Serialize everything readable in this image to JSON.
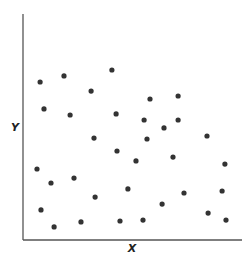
{
  "chart_data": {
    "type": "scatter",
    "title": "",
    "xlabel": "X",
    "ylabel": "Y",
    "xlim": [
      0,
      100
    ],
    "ylim": [
      0,
      100
    ],
    "grid": false,
    "legend": null,
    "ticks": "none",
    "point_color": "#333333",
    "axis_color": "#555555",
    "points": [
      {
        "x": 7.8,
        "y": 69.9
      },
      {
        "x": 18.7,
        "y": 72.6
      },
      {
        "x": 31.1,
        "y": 65.9
      },
      {
        "x": 40.6,
        "y": 75.2
      },
      {
        "x": 9.6,
        "y": 58.0
      },
      {
        "x": 21.5,
        "y": 55.3
      },
      {
        "x": 42.5,
        "y": 55.8
      },
      {
        "x": 58.0,
        "y": 62.4
      },
      {
        "x": 70.8,
        "y": 63.7
      },
      {
        "x": 55.3,
        "y": 53.1
      },
      {
        "x": 64.4,
        "y": 49.6
      },
      {
        "x": 70.8,
        "y": 53.1
      },
      {
        "x": 32.4,
        "y": 45.1
      },
      {
        "x": 56.6,
        "y": 44.7
      },
      {
        "x": 84.0,
        "y": 46.0
      },
      {
        "x": 42.9,
        "y": 39.4
      },
      {
        "x": 51.6,
        "y": 35.0
      },
      {
        "x": 68.5,
        "y": 36.7
      },
      {
        "x": 92.2,
        "y": 33.6
      },
      {
        "x": 6.4,
        "y": 31.4
      },
      {
        "x": 23.3,
        "y": 27.4
      },
      {
        "x": 12.8,
        "y": 25.2
      },
      {
        "x": 47.9,
        "y": 22.6
      },
      {
        "x": 73.5,
        "y": 20.8
      },
      {
        "x": 90.9,
        "y": 21.7
      },
      {
        "x": 63.5,
        "y": 15.9
      },
      {
        "x": 32.9,
        "y": 19.0
      },
      {
        "x": 8.2,
        "y": 13.3
      },
      {
        "x": 84.5,
        "y": 11.9
      },
      {
        "x": 14.2,
        "y": 5.8
      },
      {
        "x": 26.5,
        "y": 8.0
      },
      {
        "x": 44.3,
        "y": 8.4
      },
      {
        "x": 54.8,
        "y": 8.8
      },
      {
        "x": 92.7,
        "y": 8.8
      }
    ]
  }
}
